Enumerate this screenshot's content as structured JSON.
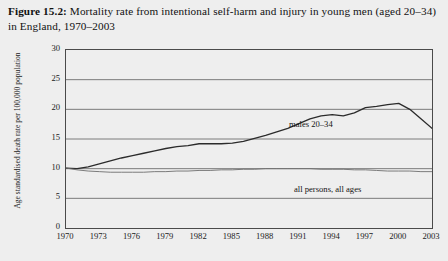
{
  "caption": {
    "label": "Figure 15.2:",
    "text": " Mortality rate from intentional self-harm and injury in young men (aged 20–34) in England, 1970–2003"
  },
  "chart_data": {
    "type": "line",
    "title": "Mortality rate from intentional self-harm and injury in young men (aged 20–34) in England, 1970–2003",
    "xlabel": "",
    "ylabel": "Age standardised death rate per 100,000 population",
    "xlim": [
      1970,
      2003
    ],
    "ylim": [
      0,
      30
    ],
    "ytick_labels": [
      "0",
      "5",
      "10",
      "15",
      "20",
      "25",
      "30"
    ],
    "ytick_values": [
      0,
      5,
      10,
      15,
      20,
      25,
      30
    ],
    "xtick_labels": [
      "1970",
      "1973",
      "1976",
      "1979",
      "1982",
      "1985",
      "1988",
      "1991",
      "1994",
      "1997",
      "2000",
      "2003"
    ],
    "xtick_values": [
      1970,
      1973,
      1976,
      1979,
      1982,
      1985,
      1988,
      1991,
      1994,
      1997,
      2000,
      2003
    ],
    "grid": "horizontal",
    "legend_position": "inline-annotations",
    "x": [
      1970,
      1971,
      1972,
      1973,
      1974,
      1975,
      1976,
      1977,
      1978,
      1979,
      1980,
      1981,
      1982,
      1983,
      1984,
      1985,
      1986,
      1987,
      1988,
      1989,
      1990,
      1991,
      1992,
      1993,
      1994,
      1995,
      1996,
      1997,
      1998,
      1999,
      2000,
      2001,
      2002,
      2003
    ],
    "series": [
      {
        "name": "males 20–34",
        "color": "#2b2b2b",
        "values": [
          10.1,
          10.0,
          10.3,
          10.8,
          11.3,
          11.8,
          12.2,
          12.6,
          13.0,
          13.4,
          13.7,
          13.9,
          14.2,
          14.2,
          14.2,
          14.3,
          14.6,
          15.1,
          15.6,
          16.2,
          16.8,
          17.6,
          18.4,
          18.9,
          19.1,
          18.9,
          19.4,
          20.3,
          20.5,
          20.8,
          21.0,
          20.0,
          18.4,
          16.8
        ]
      },
      {
        "name": "all persons, all ages",
        "color": "#6e6e6e",
        "values": [
          10.1,
          9.8,
          9.6,
          9.5,
          9.4,
          9.4,
          9.4,
          9.4,
          9.5,
          9.5,
          9.6,
          9.6,
          9.7,
          9.7,
          9.8,
          9.8,
          9.9,
          9.9,
          10.0,
          10.0,
          10.0,
          10.0,
          10.0,
          9.9,
          9.9,
          9.9,
          9.8,
          9.8,
          9.7,
          9.6,
          9.6,
          9.6,
          9.5,
          9.5
        ]
      }
    ],
    "annotations": [
      {
        "text": "males 20–34",
        "x": 1992,
        "y": 17.0
      },
      {
        "text": "all persons, all ages",
        "x": 1992,
        "y": 8.5
      }
    ]
  }
}
